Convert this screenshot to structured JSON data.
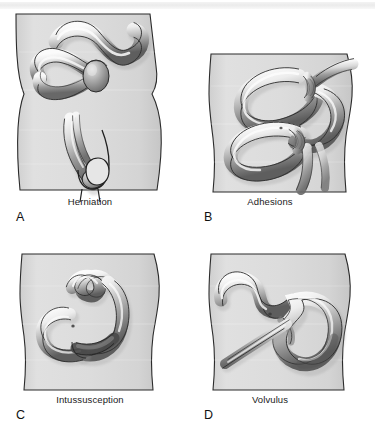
{
  "figure": {
    "type": "medical-illustration",
    "panel_count": 4
  },
  "panels": [
    {
      "letter": "A",
      "caption": "Herniation",
      "art_name": "herniation-illustration",
      "description": "Abdominal wall and groin with bowel loop protruding into an inguinal hernia sac"
    },
    {
      "letter": "B",
      "caption": "Adhesions",
      "art_name": "adhesions-illustration",
      "description": "Bowel loops constricted by fibrous adhesive bands"
    },
    {
      "letter": "C",
      "caption": "Intussusception",
      "art_name": "intussusception-illustration",
      "description": "Proximal bowel segment telescoped into distal segment"
    },
    {
      "letter": "D",
      "caption": "Volvulus",
      "art_name": "volvulus-illustration",
      "description": "Bowel loop twisted about its mesenteric axis"
    }
  ],
  "colors": {
    "page_background": "#ffffff",
    "body_fill": "#d9d9d9",
    "body_fill_light": "#e4e4e4",
    "body_outline": "#2b2b2b",
    "bowel_light": "#f0f0f0",
    "bowel_mid": "#b4b4b4",
    "bowel_dark": "#636363",
    "bowel_outline": "#2a2a2a",
    "caption_text": "#1a1a1a",
    "top_band": "#eeeeee"
  }
}
